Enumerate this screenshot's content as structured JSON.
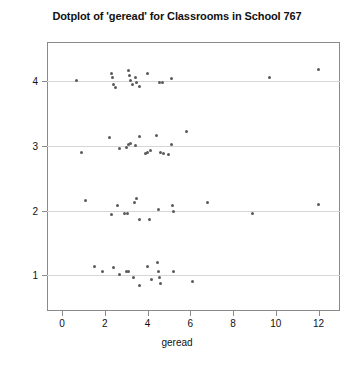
{
  "chart_data": {
    "type": "scatter",
    "title": "Dotplot of 'geread' for Classrooms in School 767",
    "xlabel": "geread",
    "ylabel": "Classroom",
    "xlim": [
      -0.7,
      13.0
    ],
    "ylim": [
      0.45,
      4.6
    ],
    "xticks": [
      0,
      2,
      4,
      6,
      8,
      10,
      12
    ],
    "yticks": [
      1,
      2,
      3,
      4
    ],
    "xtick_labels": [
      "0",
      "2",
      "4",
      "6",
      "8",
      "10",
      "12"
    ],
    "ytick_labels": [
      "1",
      "2",
      "3",
      "4"
    ],
    "grid": "horizontal-at-yticks",
    "legend": "none",
    "marker": "filled-circle",
    "marker_color": "#5a5a5a",
    "series": [
      {
        "name": "Classroom 4",
        "y": 4,
        "x": [
          0.7,
          2.3,
          2.35,
          2.4,
          2.5,
          3.1,
          3.15,
          3.2,
          3.3,
          3.45,
          3.5,
          3.6,
          4.0,
          4.55,
          4.7,
          5.1,
          9.7,
          12.0
        ],
        "y_jitter": [
          0.0,
          0.12,
          0.06,
          -0.05,
          -0.1,
          0.16,
          0.08,
          0.0,
          -0.06,
          0.06,
          -0.02,
          -0.08,
          0.12,
          -0.02,
          -0.02,
          0.04,
          0.06,
          0.18
        ]
      },
      {
        "name": "Classroom 3",
        "y": 3,
        "x": [
          0.9,
          2.2,
          2.7,
          3.0,
          3.1,
          3.2,
          3.45,
          3.6,
          3.9,
          4.0,
          4.15,
          4.4,
          4.6,
          4.75,
          5.0,
          5.1,
          5.8
        ],
        "y_jitter": [
          -0.1,
          0.12,
          -0.04,
          -0.02,
          0.02,
          0.04,
          0.0,
          0.14,
          -0.12,
          -0.1,
          -0.08,
          0.16,
          -0.1,
          -0.12,
          -0.14,
          0.02,
          0.22
        ]
      },
      {
        "name": "Classroom 2",
        "y": 2,
        "x": [
          1.1,
          2.3,
          2.6,
          2.9,
          3.05,
          3.4,
          3.5,
          3.6,
          4.1,
          4.5,
          5.15,
          5.2,
          6.8,
          8.9,
          12.0
        ],
        "y_jitter": [
          0.16,
          -0.06,
          0.08,
          -0.04,
          -0.04,
          0.12,
          0.18,
          -0.14,
          -0.14,
          0.02,
          0.08,
          -0.02,
          0.12,
          -0.04,
          0.1
        ]
      },
      {
        "name": "Classroom 1",
        "y": 1,
        "x": [
          1.5,
          1.9,
          2.4,
          2.7,
          3.0,
          3.1,
          3.35,
          3.6,
          4.0,
          4.2,
          4.45,
          4.5,
          4.55,
          4.6,
          5.2,
          6.1
        ],
        "y_jitter": [
          0.14,
          0.06,
          0.12,
          0.02,
          0.06,
          0.06,
          -0.04,
          -0.16,
          0.14,
          -0.06,
          0.2,
          0.06,
          -0.04,
          -0.12,
          0.06,
          -0.1
        ]
      }
    ]
  }
}
